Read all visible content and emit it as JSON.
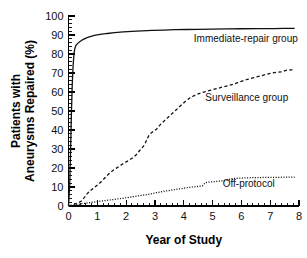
{
  "chart_data": {
    "type": "line",
    "title": "",
    "xlabel": "Year of Study",
    "ylabel": "Patients with Aneurysms Repaired (%)",
    "ylabel_line1": "Patients with",
    "ylabel_line2": "Aneurysms Repaired (%)",
    "xlim": [
      0,
      8
    ],
    "ylim": [
      0,
      100
    ],
    "xticks": [
      0,
      1,
      2,
      3,
      4,
      5,
      6,
      7,
      8
    ],
    "xtick_labels": [
      "0",
      "1",
      "2",
      "3",
      "4",
      "5",
      "6",
      "7",
      "8"
    ],
    "yticks": [
      0,
      10,
      20,
      30,
      40,
      50,
      60,
      70,
      80,
      90,
      100
    ],
    "ytick_labels": [
      "0",
      "10",
      "20",
      "30",
      "40",
      "50",
      "60",
      "70",
      "80",
      "90",
      "100"
    ],
    "x_minor_per_major": 5,
    "y_minor_per_major": 5,
    "grid": false,
    "legend_position": "inline-annotations",
    "series": [
      {
        "name": "Immediate-repair group",
        "style": "solid",
        "color": "#111111",
        "label_x": 4.35,
        "label_y": 86.5,
        "points": [
          [
            0.0,
            0.0
          ],
          [
            0.04,
            10.0
          ],
          [
            0.07,
            28.0
          ],
          [
            0.1,
            48.0
          ],
          [
            0.13,
            64.0
          ],
          [
            0.16,
            74.0
          ],
          [
            0.19,
            80.0
          ],
          [
            0.22,
            83.0
          ],
          [
            0.26,
            84.6
          ],
          [
            0.32,
            85.6
          ],
          [
            0.4,
            86.6
          ],
          [
            0.5,
            87.6
          ],
          [
            0.62,
            88.5
          ],
          [
            0.75,
            89.2
          ],
          [
            0.9,
            89.8
          ],
          [
            1.1,
            90.3
          ],
          [
            1.35,
            90.8
          ],
          [
            1.6,
            91.2
          ],
          [
            1.9,
            91.6
          ],
          [
            2.2,
            91.9
          ],
          [
            2.55,
            92.2
          ],
          [
            2.9,
            92.4
          ],
          [
            3.3,
            92.6
          ],
          [
            3.7,
            92.8
          ],
          [
            4.1,
            92.9
          ],
          [
            4.5,
            93.0
          ],
          [
            5.0,
            93.1
          ],
          [
            5.5,
            93.2
          ],
          [
            6.0,
            93.3
          ],
          [
            6.6,
            93.4
          ],
          [
            7.1,
            93.4
          ],
          [
            7.5,
            93.5
          ],
          [
            7.85,
            93.5
          ]
        ]
      },
      {
        "name": "Surveillance group",
        "style": "dashed",
        "color": "#111111",
        "label_x": 4.75,
        "label_y": 55.5,
        "points": [
          [
            0.0,
            0.0
          ],
          [
            0.15,
            0.6
          ],
          [
            0.3,
            1.4
          ],
          [
            0.45,
            2.6
          ],
          [
            0.55,
            4.5
          ],
          [
            0.65,
            6.5
          ],
          [
            0.75,
            8.0
          ],
          [
            0.85,
            9.2
          ],
          [
            0.95,
            10.4
          ],
          [
            1.05,
            11.6
          ],
          [
            1.15,
            13.0
          ],
          [
            1.25,
            14.6
          ],
          [
            1.35,
            16.2
          ],
          [
            1.45,
            17.6
          ],
          [
            1.55,
            18.8
          ],
          [
            1.65,
            19.8
          ],
          [
            1.75,
            20.8
          ],
          [
            1.85,
            21.8
          ],
          [
            1.95,
            22.8
          ],
          [
            2.05,
            23.6
          ],
          [
            2.15,
            24.6
          ],
          [
            2.25,
            25.6
          ],
          [
            2.35,
            27.0
          ],
          [
            2.45,
            28.8
          ],
          [
            2.55,
            30.6
          ],
          [
            2.65,
            32.4
          ],
          [
            2.72,
            35.0
          ],
          [
            2.8,
            37.4
          ],
          [
            2.88,
            38.6
          ],
          [
            2.96,
            39.4
          ],
          [
            3.05,
            40.4
          ],
          [
            3.15,
            42.2
          ],
          [
            3.25,
            43.8
          ],
          [
            3.35,
            45.2
          ],
          [
            3.45,
            46.6
          ],
          [
            3.55,
            48.0
          ],
          [
            3.65,
            49.4
          ],
          [
            3.75,
            50.8
          ],
          [
            3.85,
            52.2
          ],
          [
            3.95,
            53.6
          ],
          [
            4.05,
            55.0
          ],
          [
            4.15,
            56.2
          ],
          [
            4.25,
            57.2
          ],
          [
            4.35,
            58.0
          ],
          [
            4.5,
            59.0
          ],
          [
            4.65,
            59.8
          ],
          [
            4.8,
            60.4
          ],
          [
            4.95,
            61.0
          ],
          [
            5.1,
            61.6
          ],
          [
            5.25,
            62.2
          ],
          [
            5.4,
            62.8
          ],
          [
            5.55,
            63.4
          ],
          [
            5.7,
            64.0
          ],
          [
            5.85,
            64.8
          ],
          [
            6.0,
            65.6
          ],
          [
            6.2,
            66.6
          ],
          [
            6.4,
            67.4
          ],
          [
            6.6,
            68.2
          ],
          [
            6.8,
            69.0
          ],
          [
            7.0,
            69.8
          ],
          [
            7.2,
            70.3
          ],
          [
            7.4,
            70.6
          ],
          [
            7.55,
            71.4
          ],
          [
            7.7,
            71.6
          ],
          [
            7.85,
            71.7
          ]
        ]
      },
      {
        "name": "Off-protocol",
        "style": "dotted",
        "color": "#111111",
        "label_x": 5.35,
        "label_y": 10.0,
        "points": [
          [
            0.0,
            0.0
          ],
          [
            0.15,
            0.4
          ],
          [
            0.35,
            0.9
          ],
          [
            0.55,
            1.4
          ],
          [
            0.8,
            1.9
          ],
          [
            1.05,
            2.4
          ],
          [
            1.3,
            2.9
          ],
          [
            1.6,
            3.5
          ],
          [
            1.9,
            4.1
          ],
          [
            2.2,
            4.8
          ],
          [
            2.5,
            5.5
          ],
          [
            2.8,
            6.2
          ],
          [
            3.05,
            7.0
          ],
          [
            3.3,
            7.7
          ],
          [
            3.55,
            8.3
          ],
          [
            3.8,
            8.9
          ],
          [
            4.05,
            9.5
          ],
          [
            4.3,
            10.0
          ],
          [
            4.5,
            10.3
          ],
          [
            4.65,
            10.6
          ],
          [
            4.75,
            12.3
          ],
          [
            4.9,
            12.6
          ],
          [
            5.1,
            12.9
          ],
          [
            5.3,
            13.2
          ],
          [
            5.5,
            13.5
          ],
          [
            5.65,
            14.4
          ],
          [
            5.85,
            14.6
          ],
          [
            6.1,
            14.8
          ],
          [
            6.4,
            14.9
          ],
          [
            6.7,
            15.0
          ],
          [
            7.0,
            15.1
          ],
          [
            7.3,
            15.1
          ],
          [
            7.6,
            15.2
          ],
          [
            7.85,
            15.2
          ]
        ]
      }
    ]
  }
}
